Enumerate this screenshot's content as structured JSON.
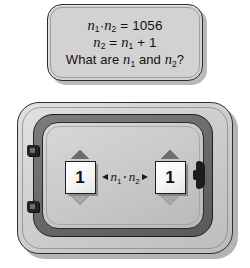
{
  "callout": {
    "name": "problem-statement",
    "lines": [
      {
        "id": "equation-product",
        "text": "n₁·n₂ = 1056"
      },
      {
        "id": "equation-successor",
        "text": "n₂ = n₁ + 1"
      },
      {
        "id": "question",
        "text": "What are n₁ and n₂?"
      }
    ],
    "equation_product": {
      "var1": "n",
      "sub1": "1",
      "operator": "·",
      "var2": "n",
      "sub2": "2",
      "equals": "=",
      "value": "1056"
    },
    "equation_successor": {
      "var1": "n",
      "sub1": "2",
      "equals": "=",
      "var2": "n",
      "sub2": "1",
      "plus": "+",
      "value": "1"
    },
    "question_parts": {
      "prefix": "What are",
      "var1": "n",
      "sub1": "1",
      "conjunction": "and",
      "var2": "n",
      "sub2": "2",
      "suffix": "?"
    }
  },
  "device": {
    "name": "calculation-panel",
    "spinner_left": {
      "label": "n1-stepper",
      "value": "1",
      "increment_icon": "triangle-up-icon",
      "decrement_icon": "triangle-down-icon"
    },
    "spinner_right": {
      "label": "n2-stepper",
      "value": "1",
      "increment_icon": "triangle-up-icon",
      "decrement_icon": "triangle-down-icon"
    },
    "product_label": {
      "var1": "n",
      "sub1": "1",
      "operator": "·",
      "var2": "n",
      "sub2": "2",
      "text": "n₁·n₂",
      "left_arrow_icon": "arrow-left-icon",
      "right_arrow_icon": "arrow-right-icon"
    },
    "hinges": [
      {
        "name": "hinge-top"
      },
      {
        "name": "hinge-bottom"
      }
    ],
    "latch": {
      "name": "panel-latch"
    }
  },
  "colors": {
    "callout_fill": "#d2d2d2",
    "panel_outer": "#cfcfcf",
    "panel_dark_band": "#6a6a6a",
    "panel_inner": "#c8c8c8",
    "box_fill": "#ffffff",
    "stroke": "#1e1e1e",
    "triangle_up": "#6d6d6d",
    "triangle_down": "#a8a8a8"
  }
}
